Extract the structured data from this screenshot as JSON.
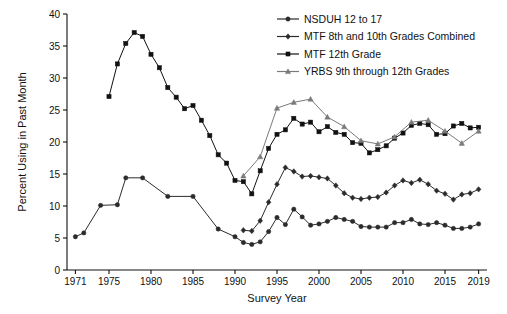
{
  "chart_data": {
    "type": "line",
    "title": "",
    "xlabel": "Survey Year",
    "ylabel": "Percent Using in Past Month",
    "xlim": [
      1970,
      2020
    ],
    "ylim": [
      0,
      40
    ],
    "yticks": [
      0,
      5,
      10,
      15,
      20,
      25,
      30,
      35,
      40
    ],
    "xticks": [
      1971,
      1975,
      1980,
      1985,
      1990,
      1995,
      2000,
      2005,
      2010,
      2015,
      2019
    ],
    "xtick_labels": [
      "1971",
      "1975",
      "1980",
      "1985",
      "1990",
      "1995",
      "2000",
      "2005",
      "2010",
      "2015",
      "2019"
    ],
    "ytick_labels": [
      "0",
      "5",
      "10",
      "15",
      "20",
      "25",
      "30",
      "35",
      "40"
    ],
    "grid": false,
    "legend_position": "top-right",
    "series": [
      {
        "name": "NSDUH 12 to 17",
        "marker": "circle",
        "color": "#2b2b2b",
        "x": [
          1971,
          1972,
          1974,
          1976,
          1977,
          1979,
          1982,
          1985,
          1988,
          1990,
          1991,
          1992,
          1993,
          1994,
          1995,
          1996,
          1997,
          1998,
          1999,
          2000,
          2001,
          2002,
          2003,
          2004,
          2005,
          2006,
          2007,
          2008,
          2009,
          2010,
          2011,
          2012,
          2013,
          2014,
          2015,
          2016,
          2017,
          2018,
          2019
        ],
        "y": [
          5.2,
          5.8,
          10.1,
          10.2,
          14.4,
          14.4,
          11.5,
          11.5,
          6.4,
          5.2,
          4.3,
          4.0,
          4.4,
          6.0,
          8.2,
          7.1,
          9.5,
          8.3,
          7.0,
          7.2,
          7.6,
          8.2,
          7.9,
          7.6,
          6.8,
          6.7,
          6.7,
          6.7,
          7.4,
          7.4,
          7.9,
          7.2,
          7.1,
          7.4,
          7.0,
          6.5,
          6.5,
          6.7,
          7.2
        ]
      },
      {
        "name": "MTF 8th and 10th Grades Combined",
        "marker": "diamond",
        "color": "#2b2b2b",
        "x": [
          1991,
          1992,
          1993,
          1994,
          1995,
          1996,
          1997,
          1998,
          1999,
          2000,
          2001,
          2002,
          2003,
          2004,
          2005,
          2006,
          2007,
          2008,
          2009,
          2010,
          2011,
          2012,
          2013,
          2014,
          2015,
          2016,
          2017,
          2018,
          2019
        ],
        "y": [
          6.2,
          6.1,
          7.7,
          10.6,
          13.4,
          16.0,
          15.4,
          14.6,
          14.7,
          14.5,
          14.3,
          13.2,
          12.0,
          11.3,
          11.1,
          11.3,
          11.4,
          12.1,
          13.2,
          14.0,
          13.6,
          14.1,
          13.4,
          12.4,
          11.9,
          11.0,
          11.8,
          12.0,
          12.6
        ]
      },
      {
        "name": "MTF 12th Grade",
        "marker": "square",
        "color": "#111111",
        "x": [
          1975,
          1976,
          1977,
          1978,
          1979,
          1980,
          1981,
          1982,
          1983,
          1984,
          1985,
          1986,
          1987,
          1988,
          1989,
          1990,
          1991,
          1992,
          1993,
          1994,
          1995,
          1996,
          1997,
          1998,
          1999,
          2000,
          2001,
          2002,
          2003,
          2004,
          2005,
          2006,
          2007,
          2008,
          2009,
          2010,
          2011,
          2012,
          2013,
          2014,
          2015,
          2016,
          2017,
          2018,
          2019
        ],
        "y": [
          27.1,
          32.2,
          35.4,
          37.1,
          36.5,
          33.7,
          31.6,
          28.5,
          27.0,
          25.2,
          25.7,
          23.4,
          21.0,
          18.0,
          16.7,
          14.0,
          13.8,
          11.9,
          15.5,
          19.0,
          21.2,
          21.9,
          23.7,
          22.8,
          23.1,
          21.6,
          22.4,
          21.5,
          21.2,
          19.9,
          19.8,
          18.3,
          18.8,
          19.4,
          20.6,
          21.4,
          22.6,
          22.9,
          22.7,
          21.2,
          21.3,
          22.5,
          22.9,
          22.2,
          22.3
        ]
      },
      {
        "name": "YRBS 9th through 12th Grades",
        "marker": "triangle",
        "color": "#7a7a7a",
        "x": [
          1991,
          1993,
          1995,
          1997,
          1999,
          2001,
          2003,
          2005,
          2007,
          2009,
          2011,
          2013,
          2015,
          2017,
          2019
        ],
        "y": [
          14.7,
          17.7,
          25.3,
          26.2,
          26.7,
          23.9,
          22.4,
          20.2,
          19.7,
          20.8,
          23.1,
          23.4,
          21.7,
          19.8,
          21.7
        ]
      }
    ]
  },
  "edge": {
    "ghost_text": ""
  }
}
